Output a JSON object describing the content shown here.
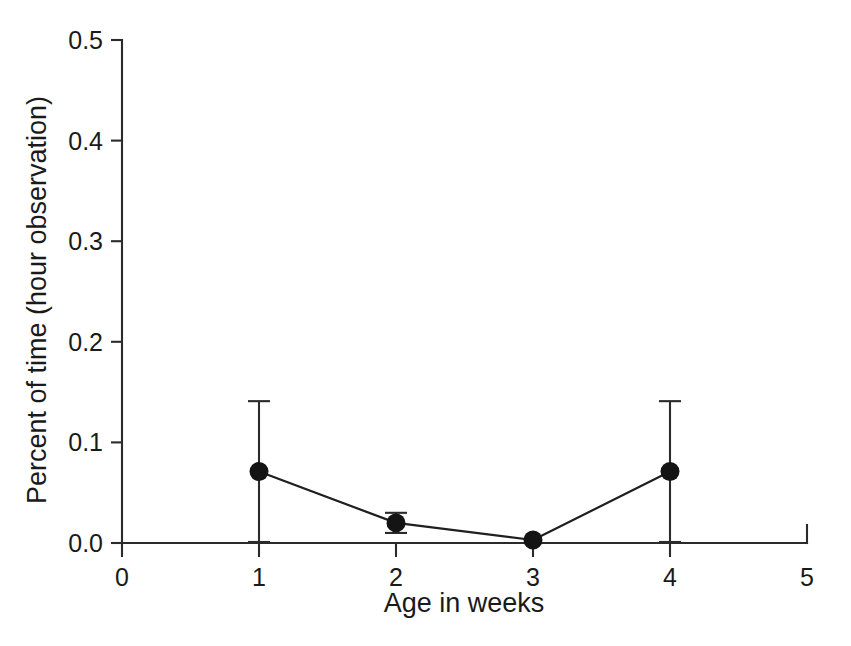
{
  "chart_data": {
    "type": "line",
    "title": "",
    "xlabel": "Age in weeks",
    "ylabel": "Percent of time (hour observation)",
    "x": [
      1,
      2,
      3,
      4
    ],
    "values": [
      0.071,
      0.02,
      0.003,
      0.071
    ],
    "error_upper": [
      0.07,
      0.01,
      0.0,
      0.07
    ],
    "error_lower": [
      0.07,
      0.01,
      0.0,
      0.07
    ],
    "xlim": [
      0,
      5
    ],
    "ylim": [
      0.0,
      0.5
    ],
    "xticks": [
      0,
      1,
      2,
      3,
      4,
      5
    ],
    "xtick_labels": [
      "0",
      "1",
      "2",
      "3",
      "4",
      "5"
    ],
    "yticks": [
      0.0,
      0.1,
      0.2,
      0.3,
      0.4,
      0.5
    ],
    "ytick_labels": [
      "0.0",
      "0.1",
      "0.2",
      "0.3",
      "0.4",
      "0.5"
    ],
    "grid": false,
    "legend": false,
    "marker": "filled-circle",
    "marker_color": "#141414",
    "line_color": "#1f1f1f",
    "errorbar_color": "#2b2b2b",
    "axis_color": "#2b2b2b",
    "background": "#ffffff",
    "series": [
      {
        "name": "Percent of time",
        "values": [
          0.071,
          0.02,
          0.003,
          0.071
        ]
      }
    ],
    "points": [
      {
        "x": 1,
        "y": 0.071,
        "err": 0.07
      },
      {
        "x": 2,
        "y": 0.02,
        "err": 0.01
      },
      {
        "x": 3,
        "y": 0.003,
        "err": 0.0
      },
      {
        "x": 4,
        "y": 0.071,
        "err": 0.07
      }
    ]
  }
}
